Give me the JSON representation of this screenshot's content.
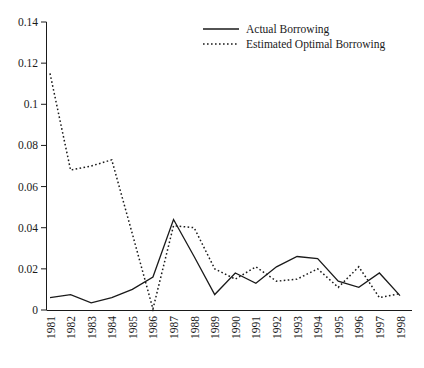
{
  "chart_data": {
    "type": "line",
    "title": "",
    "xlabel": "",
    "ylabel": "",
    "x": [
      1981,
      1982,
      1983,
      1984,
      1985,
      1986,
      1987,
      1988,
      1989,
      1990,
      1991,
      1992,
      1993,
      1994,
      1995,
      1996,
      1997,
      1998
    ],
    "categories": [
      "1981",
      "1982",
      "1983",
      "1984",
      "1985",
      "1986",
      "1987",
      "1988",
      "1989",
      "1990",
      "1991",
      "1992",
      "1993",
      "1994",
      "1995",
      "1996",
      "1997",
      "1998"
    ],
    "series": [
      {
        "name": "Actual Borrowing",
        "style": "solid",
        "color": "#1a1a1a",
        "values": [
          0.006,
          0.0075,
          0.0035,
          0.006,
          0.01,
          0.016,
          0.044,
          0.026,
          0.0075,
          0.018,
          0.013,
          0.021,
          0.026,
          0.025,
          0.014,
          0.011,
          0.018,
          0.007
        ]
      },
      {
        "name": "Estimated Optimal Borrowing",
        "style": "dotted",
        "color": "#1a1a1a",
        "values": [
          0.115,
          0.068,
          0.07,
          0.073,
          0.037,
          0.0005,
          0.041,
          0.04,
          0.02,
          0.015,
          0.021,
          0.014,
          0.015,
          0.02,
          0.011,
          0.021,
          0.006,
          0.008
        ]
      }
    ],
    "xlim": [
      1981,
      1998
    ],
    "ylim": [
      0,
      0.14
    ],
    "yticks": [
      0,
      0.02,
      0.04,
      0.06,
      0.08,
      0.1,
      0.12,
      0.14
    ],
    "ytick_labels": [
      "0",
      "0.02",
      "0.04",
      "0.06",
      "0.08",
      "0.1",
      "0.12",
      "0.14"
    ],
    "grid": false,
    "legend_position": "top-center",
    "xtick_rotation": 90
  },
  "legend": {
    "items": [
      {
        "label": "Actual Borrowing",
        "style": "solid"
      },
      {
        "label": "Estimated Optimal Borrowing",
        "style": "dotted"
      }
    ]
  }
}
